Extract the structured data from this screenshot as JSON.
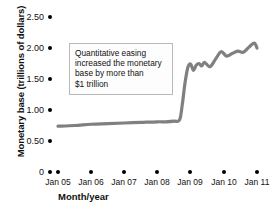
{
  "chart_data": {
    "type": "line",
    "title": "",
    "xlabel": "Month/year",
    "ylabel": "Monetary base (trillions of dollars)",
    "ylim": [
      0,
      2.5
    ],
    "yticks": [
      "0",
      "0.50",
      "1.00",
      "1.50",
      "2.00",
      "2.50"
    ],
    "ytick_values": [
      0,
      0.5,
      1.0,
      1.5,
      2.0,
      2.5
    ],
    "categories": [
      "Jan 05",
      "Jan 06",
      "Jan 07",
      "Jan 08",
      "Jan 09",
      "Jan 10",
      "Jan 11"
    ],
    "grid": false,
    "legend": null,
    "series": [
      {
        "name": "Monetary base",
        "color": "#808080",
        "x": [
          "Jan 05",
          "Jul 05",
          "Jan 06",
          "Jul 06",
          "Jan 07",
          "Jul 07",
          "Jan 08",
          "Apr 08",
          "Jul 08",
          "Sep 08",
          "Oct 08",
          "Nov 08",
          "Dec 08",
          "Jan 09",
          "Feb 09",
          "Mar 09",
          "Apr 09",
          "May 09",
          "Jun 09",
          "Aug 09",
          "Oct 09",
          "Dec 09",
          "Feb 10",
          "Apr 10",
          "Jun 10",
          "Aug 10",
          "Oct 10",
          "Dec 10",
          "Jan 11"
        ],
        "values": [
          0.74,
          0.75,
          0.77,
          0.78,
          0.79,
          0.8,
          0.81,
          0.81,
          0.82,
          0.84,
          1.1,
          1.45,
          1.69,
          1.74,
          1.64,
          1.72,
          1.75,
          1.71,
          1.77,
          1.7,
          1.82,
          1.94,
          1.87,
          1.91,
          1.95,
          1.93,
          2.01,
          2.08,
          2.0
        ]
      }
    ],
    "annotations": [
      {
        "name": "quantitative-easing-note",
        "lines": [
          "Quantitative easing",
          "increased the monetary",
          "base by more than",
          "$1 trillion"
        ]
      }
    ]
  }
}
